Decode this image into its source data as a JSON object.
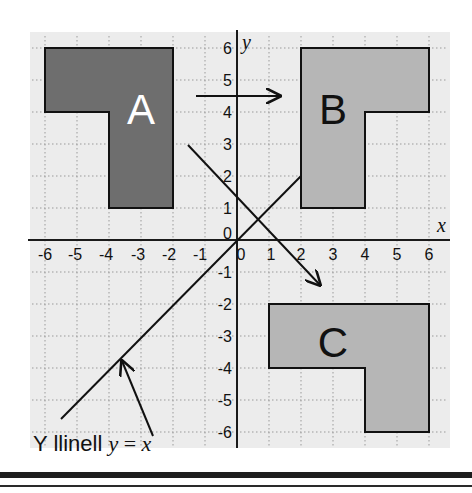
{
  "diagram": {
    "type": "coordinate-grid-transformations",
    "colors": {
      "background": "#ffffff",
      "grid_panel": "#ececec",
      "grid_lines": "#9a9a9a",
      "axis": "#1a1a1a",
      "shape_a_fill": "#6e6e6e",
      "shape_b_fill": "#b6b6b6",
      "shape_c_fill": "#b6b6b6",
      "outline": "#111111"
    },
    "axes": {
      "x_label": "x",
      "y_label": "y",
      "x_ticks": [
        "-6",
        "-5",
        "-4",
        "-3",
        "-2",
        "-1",
        "0",
        "1",
        "2",
        "3",
        "4",
        "5",
        "6"
      ],
      "y_ticks": [
        "6",
        "5",
        "4",
        "3",
        "2",
        "1",
        "0",
        "-1",
        "-2",
        "-3",
        "-4",
        "-5",
        "-6"
      ],
      "range": {
        "x": [
          -6,
          6
        ],
        "y": [
          -6,
          6
        ]
      }
    },
    "shapes": [
      {
        "name": "A",
        "label": "A",
        "vertices": [
          [
            -6,
            6
          ],
          [
            -2,
            6
          ],
          [
            -2,
            1
          ],
          [
            -4,
            1
          ],
          [
            -4,
            4
          ],
          [
            -6,
            4
          ]
        ]
      },
      {
        "name": "B",
        "label": "B",
        "vertices": [
          [
            2,
            6
          ],
          [
            6,
            6
          ],
          [
            6,
            4
          ],
          [
            4,
            4
          ],
          [
            4,
            1
          ],
          [
            2,
            1
          ]
        ]
      },
      {
        "name": "C",
        "label": "C",
        "vertices": [
          [
            1,
            -2
          ],
          [
            6,
            -2
          ],
          [
            6,
            -6
          ],
          [
            4,
            -6
          ],
          [
            4,
            -4
          ],
          [
            1,
            -4
          ]
        ]
      }
    ],
    "arrows": [
      {
        "name": "a-to-b-arrow",
        "from": [
          -1.3,
          4.5
        ],
        "to": [
          1.4,
          4.5
        ]
      },
      {
        "name": "a-to-c-arrow",
        "from": [
          -1.5,
          3
        ],
        "to": [
          2.6,
          -1.4
        ]
      }
    ],
    "mirror_line": {
      "equation": "y = x",
      "from": [
        -5.5,
        -5.6
      ],
      "to": [
        2,
        2
      ]
    },
    "annotation": {
      "text_prefix": "Y llinell ",
      "text_math_y": "y",
      "text_math_eq": " = ",
      "text_math_x": "x",
      "pointer_from": [
        -2.6,
        -6.2
      ],
      "pointer_to": [
        -3.6,
        -3.75
      ]
    }
  }
}
